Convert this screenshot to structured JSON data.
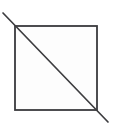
{
  "figure": {
    "title": "Square with diagonal",
    "background_color": "#ffffff",
    "canvas": {
      "width": 113,
      "height": 133
    },
    "shapes": [
      {
        "name": "square",
        "type": "rect",
        "x": 15,
        "y": 26,
        "width": 82,
        "height": 84,
        "stroke_color": "#3a3a3d",
        "stroke_width": 1.8,
        "fill_color": "#fdfdfd"
      },
      {
        "name": "diagonal",
        "type": "line",
        "x1": 3,
        "y1": 13,
        "x2": 108,
        "y2": 122,
        "stroke_color": "#3d3d40",
        "stroke_width": 1.7,
        "fill_color": "none"
      }
    ]
  }
}
